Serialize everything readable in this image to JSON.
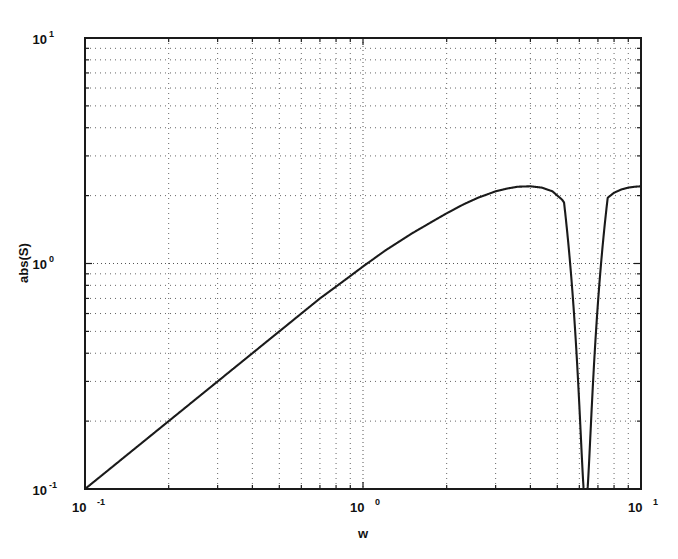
{
  "figure": {
    "background_color": "#ffffff",
    "frame_color": "#1a1a1a",
    "grid_color": "#555555",
    "curve_color": "#1a1a1a"
  },
  "axes": {
    "x": {
      "label": "w",
      "scale": "log",
      "lim": [
        0.1,
        10
      ],
      "ticks": [
        {
          "value": 0.1,
          "mantissa": "10",
          "exponent": "-1"
        },
        {
          "value": 1,
          "mantissa": "10",
          "exponent": "0"
        },
        {
          "value": 10,
          "mantissa": "10",
          "exponent": "1"
        }
      ]
    },
    "y": {
      "label": "abs(S)",
      "scale": "log",
      "lim": [
        0.1,
        10
      ],
      "ticks": [
        {
          "value": 0.1,
          "mantissa": "10",
          "exponent": "-1"
        },
        {
          "value": 1,
          "mantissa": "10",
          "exponent": "0"
        },
        {
          "value": 10,
          "mantissa": "10",
          "exponent": "1"
        }
      ]
    },
    "grid": "on-minor-dotted"
  },
  "chart_data": {
    "type": "line",
    "title": "",
    "xlabel": "w",
    "ylabel": "abs(S)",
    "xscale": "log",
    "yscale": "log",
    "xlim": [
      0.1,
      10
    ],
    "ylim": [
      0.1,
      10
    ],
    "grid": true,
    "legend": "none",
    "series": [
      {
        "name": "abs(S)",
        "x": [
          0.1,
          0.12,
          0.15,
          0.2,
          0.25,
          0.3,
          0.4,
          0.5,
          0.6,
          0.7,
          0.8,
          0.9,
          1.0,
          1.2,
          1.5,
          1.8,
          2.0,
          2.3,
          2.6,
          3.0,
          3.3,
          3.6,
          4.0,
          4.4,
          4.8,
          5.2,
          5.5,
          5.8,
          6.0,
          6.1,
          6.2,
          6.25,
          6.3,
          6.32,
          6.35,
          6.4,
          6.5,
          6.6,
          6.8,
          7.0,
          7.3,
          7.6,
          8.0,
          8.5,
          9.0,
          9.5,
          10.0
        ],
        "y": [
          0.1,
          0.12,
          0.15,
          0.2,
          0.25,
          0.3,
          0.4,
          0.5,
          0.6,
          0.7,
          0.79,
          0.88,
          0.97,
          1.14,
          1.36,
          1.55,
          1.67,
          1.83,
          1.96,
          2.09,
          2.15,
          2.19,
          2.2,
          2.17,
          2.09,
          1.92,
          1.74,
          1.45,
          1.16,
          0.95,
          0.62,
          0.38,
          0.15,
          0.1,
          0.22,
          0.45,
          0.8,
          1.05,
          1.4,
          1.62,
          1.83,
          1.96,
          2.06,
          2.13,
          2.17,
          2.19,
          2.2
        ]
      }
    ],
    "annotations": {
      "peak_value": 2.2,
      "peak_w": 4.0,
      "notch_w": 6.32,
      "notch_value": 0.1,
      "start_point": [
        0.1,
        0.1
      ],
      "end_value": 2.2,
      "low_frequency_slope": 1
    }
  }
}
